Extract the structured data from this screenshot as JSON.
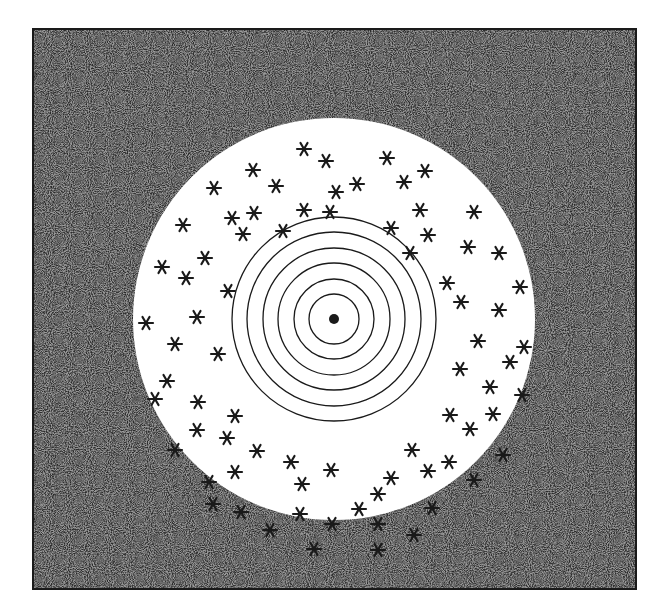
{
  "figure": {
    "colors": {
      "background": "#ffffff",
      "noise_dark": "#2a2a2a",
      "noise_light": "#9a9a9a",
      "disk": "#ffffff",
      "ink": "#1a1a1a"
    },
    "frame": {
      "x": 33,
      "y": 29,
      "width": 603,
      "height": 560
    },
    "disk": {
      "cx": 334,
      "cy": 319,
      "r": 201
    },
    "rings": {
      "cx": 334,
      "cy": 319,
      "radii": [
        25,
        40,
        56,
        71,
        87,
        102
      ]
    },
    "center_dot": {
      "cx": 334,
      "cy": 319,
      "r": 5
    },
    "markers": {
      "symbol": "asterisk",
      "size": 7,
      "points": [
        [
          304,
          149
        ],
        [
          326,
          161
        ],
        [
          387,
          158
        ],
        [
          425,
          171
        ],
        [
          253,
          170
        ],
        [
          214,
          188
        ],
        [
          276,
          186
        ],
        [
          336,
          192
        ],
        [
          357,
          184
        ],
        [
          404,
          182
        ],
        [
          232,
          218
        ],
        [
          254,
          213
        ],
        [
          304,
          210
        ],
        [
          420,
          210
        ],
        [
          474,
          212
        ],
        [
          183,
          225
        ],
        [
          243,
          234
        ],
        [
          283,
          231
        ],
        [
          330,
          212
        ],
        [
          391,
          228
        ],
        [
          428,
          235
        ],
        [
          468,
          247
        ],
        [
          499,
          253
        ],
        [
          410,
          253
        ],
        [
          205,
          258
        ],
        [
          162,
          267
        ],
        [
          186,
          278
        ],
        [
          447,
          283
        ],
        [
          520,
          287
        ],
        [
          228,
          291
        ],
        [
          461,
          302
        ],
        [
          499,
          310
        ],
        [
          146,
          323
        ],
        [
          197,
          317
        ],
        [
          175,
          344
        ],
        [
          218,
          354
        ],
        [
          478,
          341
        ],
        [
          524,
          347
        ],
        [
          510,
          362
        ],
        [
          460,
          369
        ],
        [
          167,
          381
        ],
        [
          155,
          399
        ],
        [
          198,
          402
        ],
        [
          490,
          387
        ],
        [
          522,
          395
        ],
        [
          235,
          416
        ],
        [
          450,
          415
        ],
        [
          493,
          414
        ],
        [
          197,
          430
        ],
        [
          227,
          438
        ],
        [
          470,
          429
        ],
        [
          175,
          450
        ],
        [
          257,
          451
        ],
        [
          412,
          450
        ],
        [
          503,
          455
        ],
        [
          291,
          462
        ],
        [
          331,
          470
        ],
        [
          449,
          462
        ],
        [
          428,
          471
        ],
        [
          235,
          472
        ],
        [
          209,
          482
        ],
        [
          302,
          484
        ],
        [
          391,
          478
        ],
        [
          474,
          480
        ],
        [
          378,
          494
        ],
        [
          213,
          504
        ],
        [
          241,
          512
        ],
        [
          300,
          514
        ],
        [
          359,
          509
        ],
        [
          432,
          508
        ],
        [
          270,
          530
        ],
        [
          332,
          524
        ],
        [
          378,
          524
        ],
        [
          414,
          535
        ],
        [
          314,
          549
        ],
        [
          378,
          550
        ]
      ]
    }
  }
}
